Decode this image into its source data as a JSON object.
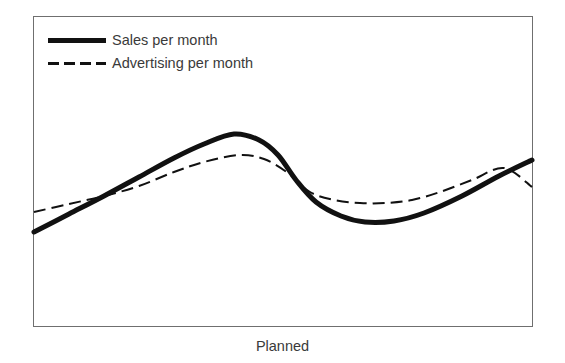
{
  "chart_data": {
    "type": "line",
    "title": "",
    "subtitle": "",
    "xlabel": "Planned",
    "ylabel": "",
    "grid": false,
    "axis_ticks": false,
    "legend_position": "top-left",
    "plot_frame": {
      "x": 33,
      "y": 16,
      "width": 500,
      "height": 311
    },
    "xlim": [
      0,
      100
    ],
    "ylim": [
      0,
      100
    ],
    "series": [
      {
        "name": "Sales per month",
        "style": "solid",
        "color": "#111111",
        "line_width": 5,
        "x": [
          0,
          7,
          14,
          21,
          28,
          34,
          40,
          46,
          52,
          58,
          63,
          68,
          73,
          78,
          84,
          90,
          95,
          100
        ],
        "values": [
          30,
          35,
          41,
          47,
          53,
          59,
          65,
          70,
          73,
          73,
          68,
          56,
          45,
          39,
          37,
          41,
          50,
          58
        ],
        "points_px": [
          [
            34,
            232
          ],
          [
            69,
            214
          ],
          [
            104,
            196
          ],
          [
            139,
            177
          ],
          [
            174,
            158
          ],
          [
            204,
            144
          ],
          [
            234,
            134
          ],
          [
            259,
            140
          ],
          [
            278,
            155
          ],
          [
            296,
            180
          ],
          [
            316,
            202
          ],
          [
            341,
            216
          ],
          [
            365,
            222
          ],
          [
            394,
            221
          ],
          [
            424,
            213
          ],
          [
            462,
            196
          ],
          [
            499,
            176
          ],
          [
            532,
            160
          ]
        ]
      },
      {
        "name": "Advertising per month",
        "style": "dashed",
        "color": "#111111",
        "line_width": 2,
        "dash_pattern": [
          12,
          6
        ],
        "x": [
          0,
          7,
          14,
          21,
          28,
          34,
          40,
          46,
          52,
          58,
          63,
          68,
          73,
          78,
          84,
          90,
          95,
          100
        ],
        "values": [
          37,
          39,
          41,
          45,
          50,
          55,
          60,
          62,
          60,
          55,
          48,
          44,
          42,
          43,
          45,
          50,
          54,
          47
        ],
        "points_px": [
          [
            34,
            212
          ],
          [
            69,
            204
          ],
          [
            104,
            196
          ],
          [
            139,
            186
          ],
          [
            174,
            172
          ],
          [
            204,
            162
          ],
          [
            239,
            155
          ],
          [
            264,
            159
          ],
          [
            288,
            173
          ],
          [
            310,
            192
          ],
          [
            334,
            200
          ],
          [
            360,
            203
          ],
          [
            386,
            203
          ],
          [
            412,
            200
          ],
          [
            440,
            192
          ],
          [
            472,
            180
          ],
          [
            504,
            168
          ],
          [
            532,
            187
          ]
        ]
      }
    ],
    "crossings_px": [
      [
        105,
        196
      ],
      [
        288,
        173
      ],
      [
        500,
        168
      ]
    ],
    "annotations": []
  },
  "legend": {
    "items": [
      {
        "label": "Sales per month",
        "swatch": "solid-line-swatch"
      },
      {
        "label": "Advertising per month",
        "swatch": "dashed-line-swatch"
      }
    ]
  },
  "axis": {
    "x_label": "Planned"
  },
  "colors": {
    "background": "#ffffff",
    "line": "#111111",
    "frame": "#6f6f6f",
    "text": "#3a3a3a"
  }
}
